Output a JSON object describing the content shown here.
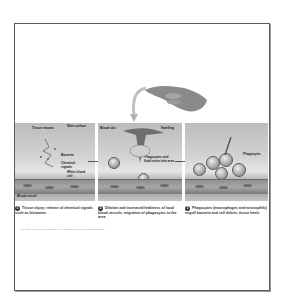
{
  "figure": {
    "panels": [
      {
        "labels": [
          "Tissue trauma",
          "Skin surface",
          "Bacteria",
          "Chemical signals",
          "White blood cell",
          "Blood vessel"
        ],
        "step": "1",
        "caption": "Tissue injury; release of chemical signals such as histamine"
      },
      {
        "labels": [
          "Blood clot",
          "Swelling",
          "Phagocytes and fluid move into area"
        ],
        "step": "2",
        "caption": "Dilation and increased leakiness of local blood vessels; migration of phagocytes to the area"
      },
      {
        "labels": [
          "Phagocytes"
        ],
        "step": "3",
        "caption": "Phagocytes (macrophages and neutrophils) engulf bacteria and cell debris; tissue heals"
      }
    ],
    "credit": "Copyright © 2009 Pearson Education, Inc., publishing as Pearson Benjamin Cummings."
  },
  "colors": {
    "frame": "#5a5a5a",
    "background": "#ffffff",
    "panel_tone": "#c8c8c8",
    "vessel": "#8e8e8e",
    "text": "#222222"
  },
  "icons": {
    "hand": "hand-icon",
    "curved_arrow": "curved-arrow-icon",
    "step_arrow": "right-arrow-icon"
  }
}
